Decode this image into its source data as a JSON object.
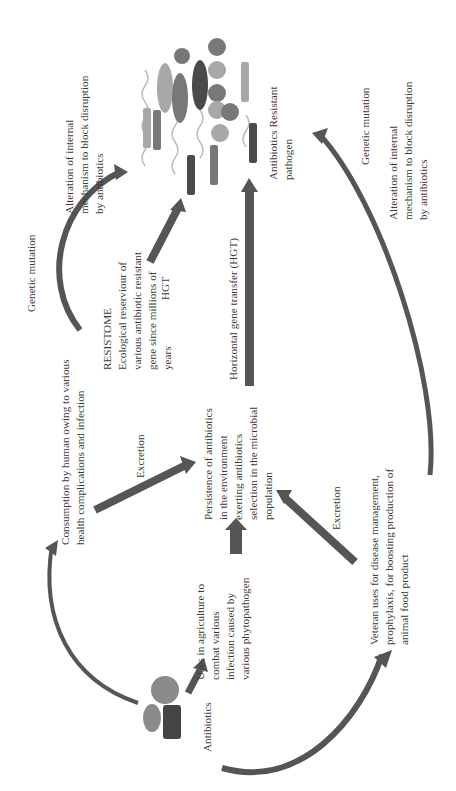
{
  "diagram": {
    "orientation": "rotated-90-ccw",
    "colors": {
      "arrow": "#555555",
      "text": "#3a3a3a",
      "dark_bacterium": "#4a4a4a",
      "mid_bacterium": "#787878",
      "light_bacterium": "#a8a8a8"
    },
    "nodes": {
      "antibiotics": {
        "label": "Antibiotics",
        "icon": "pills-icon"
      },
      "agriculture": {
        "label": "Uses in agriculture to\ncombat various\ninfection caused by\nvarious phytopathogen"
      },
      "human": {
        "label": "Consumption by human owing to various\nhealth complications and infection"
      },
      "veteran": {
        "label": "Veteran uses for disease management,\nprophylaxis, for boosting production of\nanimal food product"
      },
      "persistence": {
        "label": "Persistence of antibiotics\nin the environment\nexerting antibiotics\nselection in the microbial\npopulation"
      },
      "resistome": {
        "label": "RESISTOME\nEcological reserviour of\nvarious antibiotic resistant\ngene since millions of\nyears"
      },
      "pathogen": {
        "label": "Antibiotics Resistant\npathogen",
        "icon": "bacteria-cluster-icon"
      }
    },
    "edge_labels": {
      "excretion_human": "Excretion",
      "excretion_veteran": "Excretion",
      "hgt_short": "HGT",
      "hgt_long": "Horizontal gene transfer (HGT)",
      "genetic_mutation_left": "Genetic mutation",
      "alteration_left": "Alteration of internal\nmechanism to block disruption\nby antibiotics",
      "genetic_mutation_right": "Genetic mutation",
      "alteration_right": "Alteration of internal\nmechanism to block disruption\nby antibiotics"
    }
  }
}
